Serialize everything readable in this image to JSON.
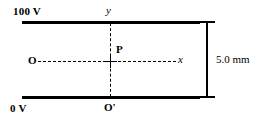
{
  "figure": {
    "plates": {
      "top_voltage_label": "100 V",
      "bottom_voltage_label": "0 V"
    },
    "axes": {
      "y_label": "y",
      "x_label": "x",
      "origin_label": "O",
      "origin_prime_label": "O'"
    },
    "points": {
      "p_label": "P"
    },
    "dimension": {
      "separation_label": "5.0 mm"
    },
    "colors": {
      "ink": "#000000",
      "background": "#ffffff"
    }
  }
}
